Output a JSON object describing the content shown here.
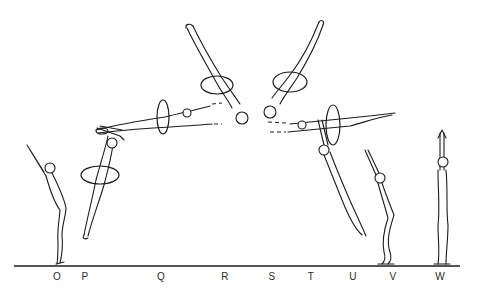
{
  "diagram": {
    "ground_line": {
      "x1": 14,
      "x2": 460,
      "y": 266,
      "color": "#1c1c1c"
    },
    "position_labels": [
      {
        "letter": "O",
        "x": 57
      },
      {
        "letter": "P",
        "x": 85
      },
      {
        "letter": "Q",
        "x": 161
      },
      {
        "letter": "R",
        "x": 225
      },
      {
        "letter": "S",
        "x": 272
      },
      {
        "letter": "T",
        "x": 311
      },
      {
        "letter": "U",
        "x": 353
      },
      {
        "letter": "V",
        "x": 393
      },
      {
        "letter": "W",
        "x": 440
      }
    ],
    "figures": [
      {
        "id": "O",
        "pose": "standing-arms-raised-back-arch"
      },
      {
        "id": "P",
        "pose": "takeoff-diving-with-twist"
      },
      {
        "id": "Q",
        "pose": "horizontal-layout-with-twist"
      },
      {
        "id": "R",
        "pose": "inverted-diagonal-with-twist"
      },
      {
        "id": "S",
        "pose": "inverted-diagonal-with-twist"
      },
      {
        "id": "T",
        "pose": "horizontal-layout-with-twist"
      },
      {
        "id": "U",
        "pose": "descending-extended"
      },
      {
        "id": "V",
        "pose": "landing-knees-bent-arms-raised"
      },
      {
        "id": "W",
        "pose": "standing-straight-arms-up"
      }
    ],
    "colors": {
      "ink": "#1c1c1c",
      "background": "#ffffff"
    }
  }
}
